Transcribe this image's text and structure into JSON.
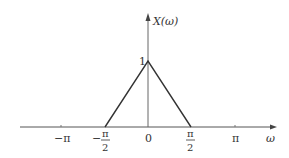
{
  "diagram": {
    "type": "function-plot",
    "function_label": "X(ω)",
    "x_axis_label": "ω",
    "peak_label": "1",
    "x_ticks": [
      {
        "label": "−π",
        "value": "-pi"
      },
      {
        "label_num": "π",
        "label_den": "2",
        "label_sign": "−",
        "value": "-pi/2"
      },
      {
        "label": "0",
        "value": "0"
      },
      {
        "label_num": "π",
        "label_den": "2",
        "label_sign": "",
        "value": "pi/2"
      },
      {
        "label": "π",
        "value": "pi"
      }
    ],
    "shape": "triangle",
    "points": [
      {
        "x": "-pi/2",
        "y": 0
      },
      {
        "x": "0",
        "y": 1
      },
      {
        "x": "pi/2",
        "y": 0
      }
    ],
    "colors": {
      "line": "#333333",
      "axis": "#555555"
    }
  }
}
